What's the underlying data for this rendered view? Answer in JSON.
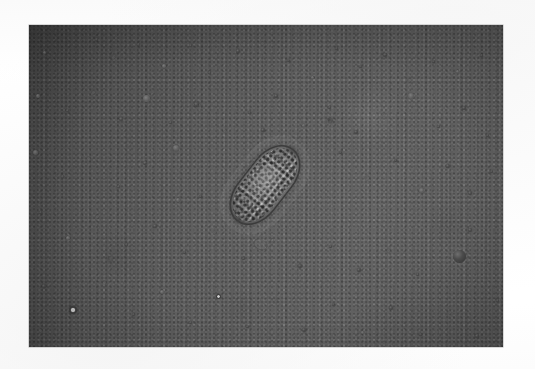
{
  "page": {
    "kind": "printed-journal-page-scan",
    "background_color": "#fdfdfd",
    "width_px": 535,
    "height_px": 369
  },
  "bleed_through": {
    "note": "extremely faint reverse-side text ghosting visible along the top margin and at the right edge; not legibly resolvable in the scan",
    "top_line_text": " ",
    "right_edge_lines": [
      " ",
      " ",
      " ",
      " "
    ]
  },
  "figure": {
    "name": "light-micrograph",
    "caption": "",
    "frame": {
      "left": 29,
      "top": 25,
      "width": 474,
      "height": 322
    },
    "media": "black-and-white halftone photomicrograph",
    "field_description": "grainy gray microscope field with scattered dark debris particles",
    "field_colors": {
      "light_gray": "#a3a3a3",
      "mid_gray": "#909090",
      "dark_gray": "#7f7f7f",
      "debris_dark": "#3a3a3a"
    },
    "specimen": {
      "name": "parasite-ovum",
      "shape": "lemon / barrel-shaped egg with granular contents",
      "orientation_degrees": 38,
      "center": {
        "x": 265,
        "y": 185
      },
      "long_axis_px": 92,
      "short_axis_px": 46,
      "features": [
        "polar plug (upper)",
        "polar plug (lower)",
        "granular internal mass",
        "refractile shell wall"
      ]
    },
    "debris_particles": [
      {
        "x": 44,
        "y": 52,
        "d": 3,
        "style": "soft"
      },
      {
        "x": 96,
        "y": 39,
        "d": 3,
        "style": ""
      },
      {
        "x": 113,
        "y": 57,
        "d": 3,
        "style": "faint"
      },
      {
        "x": 138,
        "y": 44,
        "d": 3,
        "style": ""
      },
      {
        "x": 164,
        "y": 66,
        "d": 4,
        "style": "soft"
      },
      {
        "x": 190,
        "y": 45,
        "d": 3,
        "style": ""
      },
      {
        "x": 209,
        "y": 72,
        "d": 3,
        "style": ""
      },
      {
        "x": 238,
        "y": 51,
        "d": 4,
        "style": ""
      },
      {
        "x": 262,
        "y": 43,
        "d": 3,
        "style": "faint"
      },
      {
        "x": 288,
        "y": 60,
        "d": 3,
        "style": ""
      },
      {
        "x": 312,
        "y": 77,
        "d": 3,
        "style": "soft"
      },
      {
        "x": 336,
        "y": 48,
        "d": 3,
        "style": ""
      },
      {
        "x": 360,
        "y": 66,
        "d": 3,
        "style": ""
      },
      {
        "x": 385,
        "y": 55,
        "d": 4,
        "style": ""
      },
      {
        "x": 409,
        "y": 80,
        "d": 3,
        "style": "faint"
      },
      {
        "x": 433,
        "y": 61,
        "d": 3,
        "style": ""
      },
      {
        "x": 457,
        "y": 71,
        "d": 3,
        "style": "soft"
      },
      {
        "x": 481,
        "y": 55,
        "d": 3,
        "style": ""
      },
      {
        "x": 38,
        "y": 96,
        "d": 4,
        "style": "soft"
      },
      {
        "x": 67,
        "y": 110,
        "d": 3,
        "style": ""
      },
      {
        "x": 93,
        "y": 92,
        "d": 3,
        "style": "faint"
      },
      {
        "x": 121,
        "y": 119,
        "d": 4,
        "style": ""
      },
      {
        "x": 146,
        "y": 98,
        "d": 7,
        "style": "soft"
      },
      {
        "x": 170,
        "y": 122,
        "d": 3,
        "style": ""
      },
      {
        "x": 196,
        "y": 104,
        "d": 5,
        "style": ""
      },
      {
        "x": 224,
        "y": 130,
        "d": 3,
        "style": "faint"
      },
      {
        "x": 249,
        "y": 112,
        "d": 3,
        "style": ""
      },
      {
        "x": 276,
        "y": 96,
        "d": 4,
        "style": ""
      },
      {
        "x": 303,
        "y": 125,
        "d": 3,
        "style": "soft"
      },
      {
        "x": 329,
        "y": 107,
        "d": 3,
        "style": ""
      },
      {
        "x": 356,
        "y": 132,
        "d": 4,
        "style": ""
      },
      {
        "x": 383,
        "y": 114,
        "d": 3,
        "style": "faint"
      },
      {
        "x": 411,
        "y": 96,
        "d": 6,
        "style": "soft"
      },
      {
        "x": 438,
        "y": 126,
        "d": 3,
        "style": ""
      },
      {
        "x": 464,
        "y": 108,
        "d": 4,
        "style": ""
      },
      {
        "x": 487,
        "y": 135,
        "d": 3,
        "style": ""
      },
      {
        "x": 35,
        "y": 152,
        "d": 5,
        "style": "soft"
      },
      {
        "x": 62,
        "y": 176,
        "d": 3,
        "style": ""
      },
      {
        "x": 88,
        "y": 158,
        "d": 3,
        "style": "faint"
      },
      {
        "x": 118,
        "y": 186,
        "d": 3,
        "style": ""
      },
      {
        "x": 145,
        "y": 163,
        "d": 4,
        "style": ""
      },
      {
        "x": 176,
        "y": 148,
        "d": 6,
        "style": "soft"
      },
      {
        "x": 200,
        "y": 196,
        "d": 3,
        "style": ""
      },
      {
        "x": 340,
        "y": 152,
        "d": 3,
        "style": ""
      },
      {
        "x": 367,
        "y": 178,
        "d": 4,
        "style": "faint"
      },
      {
        "x": 395,
        "y": 160,
        "d": 3,
        "style": ""
      },
      {
        "x": 421,
        "y": 190,
        "d": 5,
        "style": "soft"
      },
      {
        "x": 448,
        "y": 166,
        "d": 4,
        "style": ""
      },
      {
        "x": 470,
        "y": 193,
        "d": 4,
        "style": ""
      },
      {
        "x": 491,
        "y": 171,
        "d": 3,
        "style": ""
      },
      {
        "x": 40,
        "y": 212,
        "d": 3,
        "style": ""
      },
      {
        "x": 68,
        "y": 238,
        "d": 4,
        "style": "soft"
      },
      {
        "x": 97,
        "y": 216,
        "d": 3,
        "style": "faint"
      },
      {
        "x": 126,
        "y": 244,
        "d": 3,
        "style": ""
      },
      {
        "x": 155,
        "y": 226,
        "d": 4,
        "style": ""
      },
      {
        "x": 184,
        "y": 252,
        "d": 3,
        "style": ""
      },
      {
        "x": 214,
        "y": 232,
        "d": 3,
        "style": "faint"
      },
      {
        "x": 243,
        "y": 258,
        "d": 3,
        "style": ""
      },
      {
        "x": 272,
        "y": 240,
        "d": 3,
        "style": "soft"
      },
      {
        "x": 300,
        "y": 266,
        "d": 4,
        "style": ""
      },
      {
        "x": 330,
        "y": 246,
        "d": 3,
        "style": ""
      },
      {
        "x": 359,
        "y": 270,
        "d": 4,
        "style": ""
      },
      {
        "x": 388,
        "y": 250,
        "d": 3,
        "style": "faint"
      },
      {
        "x": 417,
        "y": 274,
        "d": 3,
        "style": ""
      },
      {
        "x": 459,
        "y": 256,
        "d": 13,
        "style": "big"
      },
      {
        "x": 489,
        "y": 262,
        "d": 3,
        "style": ""
      },
      {
        "x": 44,
        "y": 286,
        "d": 4,
        "style": ""
      },
      {
        "x": 73,
        "y": 310,
        "d": 8,
        "style": "ring"
      },
      {
        "x": 104,
        "y": 282,
        "d": 3,
        "style": "faint"
      },
      {
        "x": 133,
        "y": 314,
        "d": 3,
        "style": ""
      },
      {
        "x": 162,
        "y": 292,
        "d": 4,
        "style": "soft"
      },
      {
        "x": 190,
        "y": 322,
        "d": 3,
        "style": ""
      },
      {
        "x": 218,
        "y": 296,
        "d": 5,
        "style": "ring"
      },
      {
        "x": 247,
        "y": 326,
        "d": 3,
        "style": ""
      },
      {
        "x": 275,
        "y": 300,
        "d": 3,
        "style": "faint"
      },
      {
        "x": 304,
        "y": 330,
        "d": 4,
        "style": ""
      },
      {
        "x": 333,
        "y": 304,
        "d": 3,
        "style": ""
      },
      {
        "x": 362,
        "y": 332,
        "d": 3,
        "style": "soft"
      },
      {
        "x": 391,
        "y": 308,
        "d": 4,
        "style": ""
      },
      {
        "x": 420,
        "y": 334,
        "d": 3,
        "style": ""
      },
      {
        "x": 449,
        "y": 312,
        "d": 3,
        "style": "faint"
      },
      {
        "x": 477,
        "y": 336,
        "d": 4,
        "style": ""
      },
      {
        "x": 497,
        "y": 300,
        "d": 3,
        "style": ""
      },
      {
        "x": 110,
        "y": 258,
        "d": 5,
        "style": "streak"
      },
      {
        "x": 330,
        "y": 120,
        "d": 5,
        "style": "streak"
      },
      {
        "x": 178,
        "y": 200,
        "d": 4,
        "style": "soft"
      },
      {
        "x": 470,
        "y": 230,
        "d": 4,
        "style": ""
      },
      {
        "x": 40,
        "y": 330,
        "d": 3,
        "style": "faint"
      },
      {
        "x": 263,
        "y": 130,
        "d": 4,
        "style": ""
      }
    ]
  }
}
